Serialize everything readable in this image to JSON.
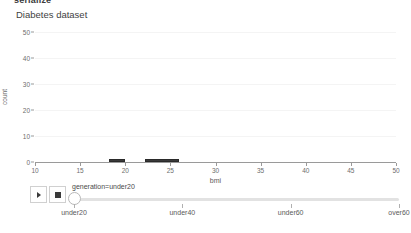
{
  "header": {
    "cropped_title": "serialize"
  },
  "panel": {
    "title": "Diabetes dataset"
  },
  "chart_data": {
    "type": "bar",
    "title": "Diabetes dataset",
    "xlabel": "bmi",
    "ylabel": "count",
    "xlim": [
      10,
      50
    ],
    "ylim": [
      0,
      50
    ],
    "xticks": [
      10,
      15,
      20,
      25,
      30,
      35,
      40,
      45,
      50
    ],
    "yticks": [
      0,
      10,
      20,
      30,
      40,
      50
    ],
    "grid": true,
    "legend": "none",
    "bar_color": "#3a3a3a",
    "bins": [
      {
        "x0": 18.2,
        "x1": 20.0,
        "value": 1
      },
      {
        "x0": 22.2,
        "x1": 26.0,
        "value": 1
      }
    ]
  },
  "player": {
    "play_label": "play",
    "stop_label": "stop"
  },
  "slider": {
    "value_label": "generation=under20",
    "value": "under20",
    "ticks": [
      "under20",
      "under40",
      "under60",
      "over60"
    ]
  }
}
